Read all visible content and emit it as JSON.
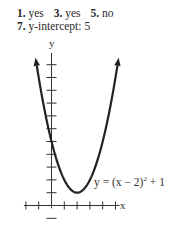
{
  "answers": [
    {
      "num": "1.",
      "text": "yes"
    },
    {
      "num": "3.",
      "text": "yes"
    },
    {
      "num": "5.",
      "text": "no"
    },
    {
      "num": "7.",
      "text": "y-intercept: 5"
    }
  ],
  "graph": {
    "x_axis_label": "x",
    "y_axis_label": "y",
    "equation_label": "y = (x − 2)² + 1",
    "equation_parts": {
      "lhs": "y = (x − 2)",
      "exp": "2",
      "rhs": " + 1"
    },
    "vertex": [
      2,
      1
    ],
    "y_intercept": 5
  },
  "chart_data": {
    "type": "line",
    "title": "",
    "function": "y = (x - 2)^2 + 1",
    "xlabel": "x",
    "ylabel": "y",
    "x": [
      -1,
      0,
      1,
      2,
      3,
      4,
      5
    ],
    "values": [
      10,
      5,
      2,
      1,
      2,
      5,
      10
    ],
    "xlim": [
      -2,
      5
    ],
    "ylim": [
      -1,
      12
    ],
    "grid": false,
    "x_ticks": [
      -2,
      -1,
      1,
      2,
      3,
      4,
      5
    ],
    "y_ticks": [
      -1,
      1,
      2,
      3,
      4,
      5,
      6,
      7,
      8,
      9,
      10,
      11
    ],
    "tick_labels_shown": false,
    "annotations": [
      "y = (x − 2)² + 1"
    ]
  }
}
